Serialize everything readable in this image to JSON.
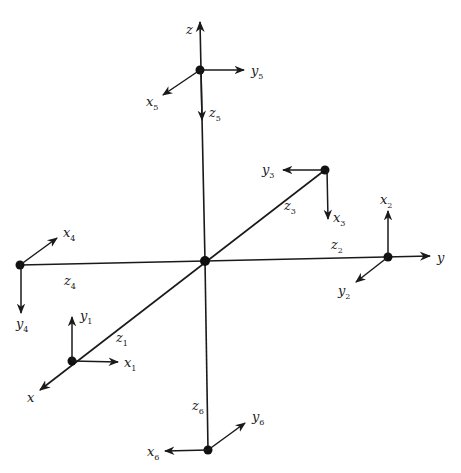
{
  "diagram": {
    "global_axes": {
      "x": {
        "label": "x"
      },
      "y": {
        "label": "y"
      },
      "z": {
        "label": "z"
      }
    },
    "frames": [
      {
        "id": 1,
        "labels": {
          "x": "x",
          "y": "y",
          "z": "z"
        },
        "sub": "1"
      },
      {
        "id": 2,
        "labels": {
          "x": "x",
          "y": "y",
          "z": "z"
        },
        "sub": "2"
      },
      {
        "id": 3,
        "labels": {
          "x": "x",
          "y": "y",
          "z": "z"
        },
        "sub": "3"
      },
      {
        "id": 4,
        "labels": {
          "x": "x",
          "y": "y",
          "z": "z"
        },
        "sub": "4"
      },
      {
        "id": 5,
        "labels": {
          "x": "x",
          "y": "y",
          "z": "z"
        },
        "sub": "5"
      },
      {
        "id": 6,
        "labels": {
          "x": "x",
          "y": "y",
          "z": "z"
        },
        "sub": "6"
      }
    ]
  }
}
